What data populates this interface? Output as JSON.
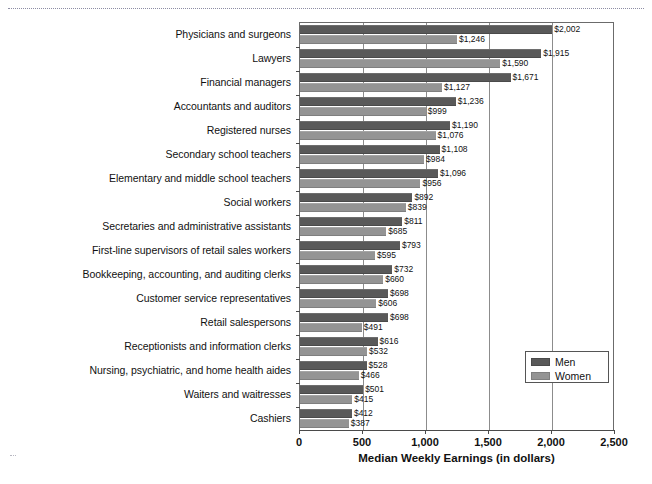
{
  "chart_data": {
    "type": "bar",
    "orientation": "horizontal",
    "title": "",
    "xlabel": "Median Weekly Earnings (in dollars)",
    "ylabel": "",
    "xlim": [
      0,
      2500
    ],
    "xticks": [
      "0",
      "500",
      "1,000",
      "1,500",
      "2,000",
      "2,500"
    ],
    "xtick_values": [
      0,
      500,
      1000,
      1500,
      2000,
      2500
    ],
    "grid": true,
    "grid_axis": "x",
    "legend_position": "lower-right-inside",
    "categories": [
      "Physicians and surgeons",
      "Lawyers",
      "Financial managers",
      "Accountants and auditors",
      "Registered nurses",
      "Secondary school teachers",
      "Elementary and middle school teachers",
      "Social workers",
      "Secretaries and administrative assistants",
      "First-line supervisors of retail sales workers",
      "Bookkeeping, accounting, and auditing clerks",
      "Customer service representatives",
      "Retail salespersons",
      "Receptionists and information clerks",
      "Nursing, psychiatric, and home health aides",
      "Waiters and waitresses",
      "Cashiers"
    ],
    "series": [
      {
        "name": "Men",
        "color": "#595959",
        "values": [
          2002,
          1915,
          1671,
          1236,
          1190,
          1108,
          1096,
          892,
          811,
          793,
          732,
          698,
          698,
          616,
          528,
          501,
          412
        ],
        "labels": [
          "$2,002",
          "$1,915",
          "$1,671",
          "$1,236",
          "$1,190",
          "$1,108",
          "$1,096",
          "$892",
          "$811",
          "$793",
          "$732",
          "$698",
          "$698",
          "$616",
          "$528",
          "$501",
          "$412"
        ]
      },
      {
        "name": "Women",
        "color": "#949494",
        "values": [
          1246,
          1590,
          1127,
          999,
          1076,
          984,
          956,
          839,
          685,
          595,
          660,
          606,
          491,
          532,
          466,
          415,
          387
        ],
        "labels": [
          "$1,246",
          "$1,590",
          "$1,127",
          "$999",
          "$1,076",
          "$984",
          "$956",
          "$839",
          "$685",
          "$595",
          "$660",
          "$606",
          "$491",
          "$532",
          "$466",
          "$415",
          "$387"
        ]
      }
    ]
  },
  "legend": {
    "items": [
      {
        "label": "Men"
      },
      {
        "label": "Women"
      }
    ]
  }
}
